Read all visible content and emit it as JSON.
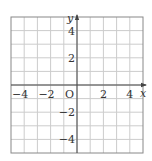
{
  "diagram": {
    "type": "coordinate-grid",
    "x_range": [
      -5,
      5
    ],
    "y_range": [
      -5,
      5
    ],
    "grid_step": 1,
    "axis_labels": {
      "x": "x",
      "y": "y"
    },
    "origin_label": "O",
    "x_tick_labels": [
      {
        "value": -4,
        "text": "−4"
      },
      {
        "value": -2,
        "text": "−2"
      },
      {
        "value": 2,
        "text": "2"
      },
      {
        "value": 4,
        "text": "4"
      }
    ],
    "y_tick_labels": [
      {
        "value": 4,
        "text": "4"
      },
      {
        "value": 2,
        "text": "2"
      },
      {
        "value": -2,
        "text": "−2"
      },
      {
        "value": -4,
        "text": "−4"
      }
    ],
    "colors": {
      "grid": "#cccccc",
      "border": "#888888",
      "axis": "#444444",
      "text": "#333333"
    }
  }
}
